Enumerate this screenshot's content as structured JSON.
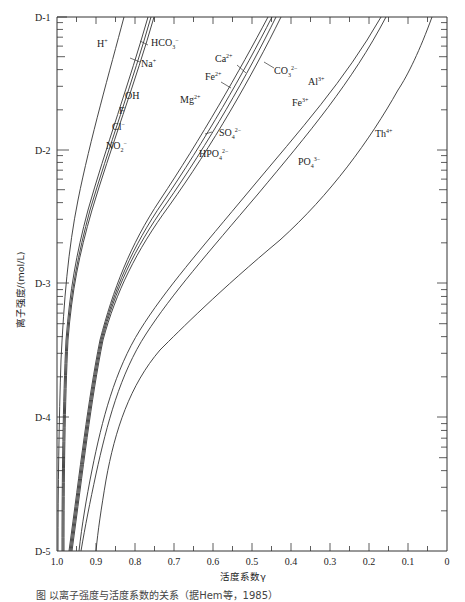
{
  "chart_data": {
    "type": "line",
    "title": "",
    "xlabel": "活度系数γ",
    "ylabel": "离子强度/(mol/L)",
    "x_axis": {
      "reversed": true,
      "range": [
        1.0,
        0
      ],
      "ticks": [
        "1.0",
        "0.9",
        "0.8",
        "0.7",
        "0.6",
        "0.5",
        "0.4",
        "0.3",
        "0.2",
        "0.1",
        "0"
      ]
    },
    "y_axis": {
      "scale": "log",
      "range": [
        "D-5",
        "D-1"
      ],
      "ticks": [
        "D-1",
        "D-2",
        "D-3",
        "D-4",
        "D-5"
      ]
    },
    "grid": false,
    "series": [
      {
        "name": "H+",
        "ionic_strength": [
          1e-05,
          0.0001,
          0.001,
          0.01,
          0.1
        ],
        "gamma": [
          0.997,
          0.99,
          0.97,
          0.91,
          0.83
        ]
      },
      {
        "name": "HCO3-/Na+/OH-/F-/Cl-/NO2- group",
        "ionic_strength": [
          1e-05,
          0.0001,
          0.001,
          0.01,
          0.1
        ],
        "gamma": [
          0.99,
          0.985,
          0.96,
          0.9,
          0.77
        ]
      },
      {
        "name": "Ca2+/Fe2+/Mg2+/CO3 2-/SO4 2-/HPO4 2- group",
        "ionic_strength": [
          1e-05,
          0.0001,
          0.001,
          0.01,
          0.1
        ],
        "gamma": [
          0.97,
          0.94,
          0.85,
          0.66,
          0.45
        ]
      },
      {
        "name": "Al3+/Fe3+/PO4 3- group",
        "ionic_strength": [
          1e-05,
          0.0001,
          0.001,
          0.01,
          0.1
        ],
        "gamma": [
          0.95,
          0.88,
          0.71,
          0.43,
          0.18
        ]
      },
      {
        "name": "Th4+",
        "ionic_strength": [
          1e-05,
          0.0001,
          0.001,
          0.01,
          0.1
        ],
        "gamma": [
          0.9,
          0.8,
          0.56,
          0.25,
          0.04
        ]
      }
    ],
    "annotations": [
      "H+",
      "HCO3-",
      "Na+",
      "OH",
      "F",
      "Cl-",
      "NO2-",
      "Ca2+",
      "Fe2+",
      "Mg2+",
      "CO3 2-",
      "SO4 2-",
      "HPO4 2-",
      "Al3+",
      "Fe3+",
      "PO4 3-",
      "Th4+"
    ]
  },
  "axes": {
    "x_title": "活度系数γ",
    "y_title": "离子强度/(mol/L)",
    "x_ticks": [
      "1.0",
      "0.9",
      "0.8",
      "0.7",
      "0.6",
      "0.5",
      "0.4",
      "0.3",
      "0.2",
      "0.1",
      "0"
    ],
    "y_ticks": [
      "D-1",
      "D-2",
      "D-3",
      "D-4",
      "D-5"
    ]
  },
  "labels": {
    "h": "H",
    "h_sup": "+",
    "hco3": "HCO",
    "hco3_sub": "3",
    "hco3_sup": "−",
    "na": "Na",
    "na_sup": "+",
    "oh": "OH",
    "f": "F",
    "cl": "Cl",
    "cl_sup": "−",
    "no2": "NO",
    "no2_sub": "2",
    "no2_sup": "−",
    "ca": "Ca",
    "ca_sup": "2+",
    "fe2": "Fe",
    "fe2_sup": "2+",
    "mg": "Mg",
    "mg_sup": "2+",
    "co3": "CO",
    "co3_sub": "3",
    "co3_sup": "2−",
    "so4": "SO",
    "so4_sub": "4",
    "so4_sup": "2−",
    "hpo4": "HPO",
    "hpo4_sub": "4",
    "hpo4_sup": "2−",
    "al": "Al",
    "al_sup": "3+",
    "fe3": "Fe",
    "fe3_sup": "3+",
    "po4": "PO",
    "po4_sub": "4",
    "po4_sup": "3−",
    "th": "Th",
    "th_sup": "4+"
  },
  "caption": "图    以离子强度与活度系数的关系（据Hem等，1985）"
}
